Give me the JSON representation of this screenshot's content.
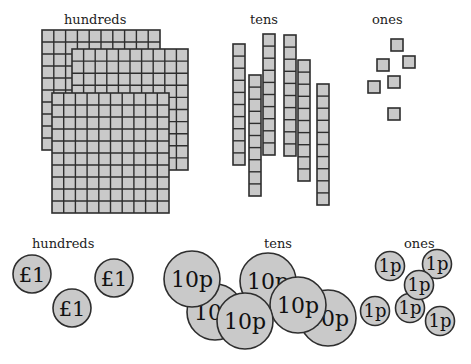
{
  "blocks": {
    "labels": {
      "hundreds": "hundreds",
      "tens": "tens",
      "ones": "ones"
    },
    "hundreds_count": 3,
    "tens_count": 6,
    "ones_count": 6,
    "cells_per_side": 10
  },
  "coins": {
    "labels": {
      "hundreds": "hundreds",
      "tens": "tens",
      "ones": "ones"
    },
    "pound_label": "£1",
    "ten_pence_label": "10p",
    "one_pence_label": "1p",
    "pound_count": 3,
    "ten_pence_count": 6,
    "one_pence_count": 6
  },
  "colors": {
    "fill": "#c9c9c9",
    "stroke": "#2e2e2e"
  }
}
